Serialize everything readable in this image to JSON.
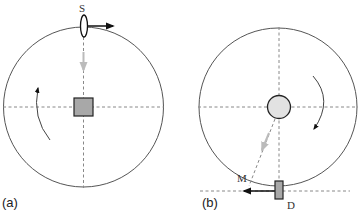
{
  "panels": [
    {
      "id": "a",
      "panel_label": "(a)",
      "source_label": "S",
      "center_object": "square",
      "rotation": "counterclockwise"
    },
    {
      "id": "b",
      "panel_label": "(b)",
      "detector_label": "D",
      "ray_label": "M",
      "center_object": "circle",
      "rotation": "clockwise"
    }
  ],
  "colors": {
    "outline": "#555555",
    "dashed": "#888888",
    "fill_gray": "#a8a8a8",
    "fill_light": "#e2e2e2",
    "arrow_black": "#111111",
    "arrow_gray": "#bbbbbb"
  }
}
